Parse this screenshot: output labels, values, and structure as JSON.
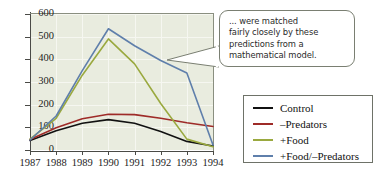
{
  "chart_data": {
    "type": "line",
    "title": "",
    "xlabel": "",
    "ylabel": "",
    "x": [
      1987,
      1988,
      1989,
      1990,
      1991,
      1992,
      1993,
      1994
    ],
    "xticklabels": [
      "1987",
      "1988",
      "1989",
      "1990",
      "1991",
      "1992",
      "1993",
      "1994"
    ],
    "yticklabels": [
      "0",
      "100",
      "200",
      "300",
      "400",
      "500",
      "600"
    ],
    "yticks": [
      0,
      100,
      200,
      300,
      400,
      500,
      600
    ],
    "ylim": [
      0,
      600
    ],
    "xlim": [
      1987,
      1994
    ],
    "grid": true,
    "legend_position": "right",
    "series": [
      {
        "name": "Control",
        "color": "#111111",
        "values": [
          42,
          85,
          118,
          134,
          118,
          82,
          38,
          18
        ]
      },
      {
        "name": "–Predators",
        "color": "#9e2b28",
        "values": [
          46,
          98,
          138,
          158,
          156,
          140,
          120,
          104
        ]
      },
      {
        "name": "+Food",
        "color": "#9aa93f",
        "values": [
          48,
          140,
          330,
          490,
          380,
          205,
          48,
          14
        ]
      },
      {
        "name": "+Food/–Predators",
        "color": "#5f7fab",
        "values": [
          44,
          150,
          350,
          535,
          460,
          395,
          340,
          22
        ]
      }
    ]
  },
  "annotation": {
    "name": "callout-note",
    "lines": [
      "... were matched",
      "fairly closely by these",
      "predictions from a",
      "mathematical model."
    ]
  },
  "legend": {
    "items": [
      {
        "label": "Control",
        "color": "#111111"
      },
      {
        "label": "–Predators",
        "color": "#9e2b28"
      },
      {
        "label": "+Food",
        "color": "#9aa93f"
      },
      {
        "label": "+Food/–Predators",
        "color": "#5f7fab"
      }
    ]
  },
  "colors": {
    "plot_background": "#e9ecdf",
    "axis": "#4a4a46",
    "gridline": "#f6f7f1",
    "page_background": "#ffffff"
  }
}
